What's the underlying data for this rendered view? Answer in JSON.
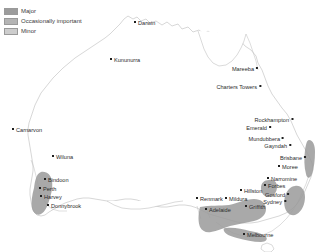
{
  "map": {
    "title": "Australia production regions",
    "legend": {
      "items": [
        {
          "label": "Major",
          "color": "#9c9c9c"
        },
        {
          "label": "Occasionally important",
          "color": "#b4b4b4"
        },
        {
          "label": "Minor",
          "color": "#cdcdcd"
        }
      ]
    },
    "outline_color": "#b9b9b9",
    "region_fill": "#9a9a9a",
    "cities": [
      {
        "name": "Darwin",
        "x": 134,
        "y": 22,
        "side": "right"
      },
      {
        "name": "Kununurra",
        "x": 110,
        "y": 59,
        "side": "right"
      },
      {
        "name": "Mareeba",
        "x": 262,
        "y": 68,
        "side": "left"
      },
      {
        "name": "Charters Towers",
        "x": 265,
        "y": 86,
        "side": "left"
      },
      {
        "name": "Carnarvon",
        "x": 12,
        "y": 129,
        "side": "right"
      },
      {
        "name": "Rockhampton",
        "x": 297,
        "y": 119,
        "side": "left"
      },
      {
        "name": "Emerald",
        "x": 275,
        "y": 127,
        "side": "left"
      },
      {
        "name": "Mundubbera",
        "x": 288,
        "y": 138,
        "side": "left"
      },
      {
        "name": "Gayndah",
        "x": 295,
        "y": 145,
        "side": "left"
      },
      {
        "name": "Wiluna",
        "x": 52,
        "y": 156,
        "side": "right"
      },
      {
        "name": "Brisbane",
        "x": 310,
        "y": 157,
        "side": "left"
      },
      {
        "name": "Moree",
        "x": 278,
        "y": 166,
        "side": "right"
      },
      {
        "name": "Bindoon",
        "x": 44,
        "y": 179,
        "side": "right"
      },
      {
        "name": "Narromine",
        "x": 267,
        "y": 178,
        "side": "right"
      },
      {
        "name": "Forbes",
        "x": 264,
        "y": 185,
        "side": "right"
      },
      {
        "name": "Perth",
        "x": 39,
        "y": 188,
        "side": "right"
      },
      {
        "name": "Hillston",
        "x": 240,
        "y": 190,
        "side": "right"
      },
      {
        "name": "Gosford",
        "x": 293,
        "y": 194,
        "side": "left"
      },
      {
        "name": "Harvey",
        "x": 40,
        "y": 196,
        "side": "right"
      },
      {
        "name": "Renmark",
        "x": 196,
        "y": 198,
        "side": "right"
      },
      {
        "name": "Mildura",
        "x": 225,
        "y": 198,
        "side": "right"
      },
      {
        "name": "Sydney",
        "x": 290,
        "y": 201,
        "side": "left"
      },
      {
        "name": "Donnybrook",
        "x": 47,
        "y": 205,
        "side": "right"
      },
      {
        "name": "Griffith",
        "x": 245,
        "y": 206,
        "side": "right"
      },
      {
        "name": "Adelaide",
        "x": 205,
        "y": 209,
        "side": "right"
      },
      {
        "name": "Melbourne",
        "x": 243,
        "y": 234,
        "side": "right"
      }
    ]
  }
}
